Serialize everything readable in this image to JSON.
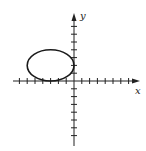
{
  "chart_data": {
    "type": "line",
    "title": "",
    "xlabel": "x",
    "ylabel": "y",
    "xlim": [
      -8,
      8.5
    ],
    "ylim": [
      -8,
      8.5
    ],
    "grid": false,
    "x_ticks": [
      -7,
      -6,
      -5,
      -4,
      -3,
      -2,
      -1,
      1,
      2,
      3,
      4,
      5,
      6,
      7
    ],
    "y_ticks": [
      -7,
      -6,
      -5,
      -4,
      -3,
      -2,
      -1,
      1,
      2,
      3,
      4,
      5,
      6,
      7
    ],
    "tick_labels_shown": false,
    "series": [
      {
        "name": "ellipse",
        "shape": "ellipse",
        "center": [
          -3,
          2
        ],
        "semi_axis_x": 3,
        "semi_axis_y": 2,
        "equation": "(x+3)^2/9 + (y-2)^2/4 = 1",
        "color": "#1a1a1a"
      }
    ]
  },
  "labels": {
    "x_axis": "x",
    "y_axis": "y"
  },
  "colors": {
    "axis": "#222222",
    "curve": "#1a1a1a",
    "background": "#ffffff"
  }
}
